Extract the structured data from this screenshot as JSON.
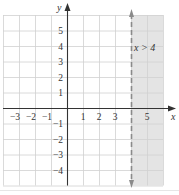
{
  "chart_data": {
    "type": "inequality-graph",
    "title": "",
    "inequality": "x > 4",
    "boundary": {
      "x": 4,
      "style": "dashed",
      "included": false
    },
    "shaded_region": {
      "x_from": 4,
      "x_to": 6,
      "y_from": -5,
      "y_to": 6
    },
    "xlabel": "x",
    "ylabel": "y",
    "xlim": [
      -4,
      6
    ],
    "ylim": [
      -5,
      6
    ],
    "x_ticks": [
      -3,
      -2,
      -1,
      1,
      2,
      3,
      5
    ],
    "y_ticks": [
      -4,
      -3,
      -2,
      -1,
      1,
      2,
      3,
      4,
      5
    ],
    "grid": true,
    "annotation": {
      "text": "x > 4",
      "x": 5,
      "y": 4
    }
  },
  "colors": {
    "grid": "#d0d0d0",
    "axis": "#333333",
    "shade": "#e4e4e4",
    "boundary": "#8a8a8a",
    "text": "#333333"
  }
}
